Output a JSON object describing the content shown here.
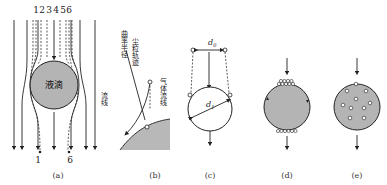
{
  "figure": {
    "panels": [
      {
        "id": "a",
        "caption": "(a)",
        "droplet_label": "液滴",
        "streamline_label": "流线",
        "trajectory_numbers_top": [
          "1",
          "2",
          "3",
          "4",
          "5",
          "6"
        ],
        "trajectory_numbers_bottom": [
          "1",
          "6"
        ]
      },
      {
        "id": "b",
        "caption": "(b)",
        "labels": [
          "曲率半径",
          "尘粒轨迹",
          "气体流线"
        ]
      },
      {
        "id": "c",
        "caption": "(c)",
        "label_d0": "d",
        "label_d0_sub": "0",
        "label_d1": "d",
        "label_d1_sub": "1"
      },
      {
        "id": "d",
        "caption": "(d)"
      },
      {
        "id": "e",
        "caption": "(e)"
      }
    ],
    "colors": {
      "droplet_fill": "#b4b4b4",
      "line": "#222222",
      "background": "#ffffff"
    }
  }
}
